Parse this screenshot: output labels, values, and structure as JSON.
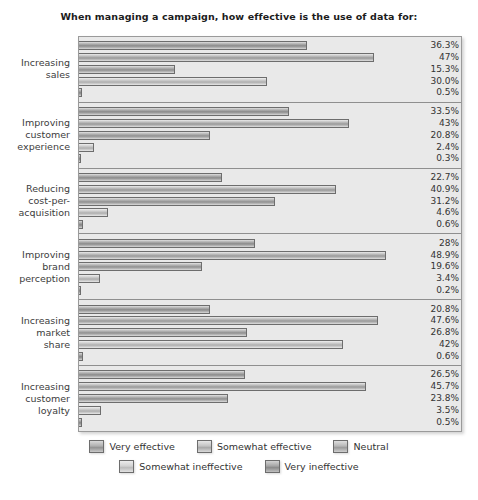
{
  "chart_data": {
    "type": "bar",
    "orientation": "horizontal",
    "title": "When managing a campaign, how effective is the use of data for:",
    "xlabel": "",
    "ylabel": "",
    "grid": false,
    "legend_position": "bottom",
    "xlim": [
      0,
      50
    ],
    "categories": [
      "Increasing sales",
      "Improving customer experience",
      "Reducing cost-per-acquisition",
      "Improving brand perception",
      "Increasing market share",
      "Increasing customer loyalty"
    ],
    "series": [
      {
        "name": "Very effective",
        "values": [
          36.3,
          33.5,
          22.7,
          28.0,
          20.8,
          26.5
        ]
      },
      {
        "name": "Somewhat effective",
        "values": [
          47.0,
          43.0,
          40.9,
          48.9,
          47.6,
          45.7
        ]
      },
      {
        "name": "Neutral",
        "values": [
          15.3,
          20.8,
          31.2,
          19.6,
          26.8,
          23.8
        ]
      },
      {
        "name": "Somewhat ineffective",
        "values": [
          30.0,
          2.4,
          4.6,
          3.4,
          42.0,
          3.5
        ]
      },
      {
        "name": "Very ineffective",
        "values": [
          0.5,
          0.3,
          0.6,
          0.2,
          0.6,
          0.5
        ]
      }
    ],
    "value_labels": [
      [
        "36.3%",
        "47%",
        "15.3%",
        "30.0%",
        "0.5%"
      ],
      [
        "33.5%",
        "43%",
        "20.8%",
        "2.4%",
        "0.3%"
      ],
      [
        "22.7%",
        "40.9%",
        "31.2%",
        "4.6%",
        "0.6%"
      ],
      [
        "28%",
        "48.9%",
        "19.6%",
        "3.4%",
        "0.2%"
      ],
      [
        "20.8%",
        "47.6%",
        "26.8%",
        "42%",
        "0.6%"
      ],
      [
        "26.5%",
        "45.7%",
        "23.8%",
        "3.5%",
        "0.5%"
      ]
    ]
  },
  "title": {
    "text": "When managing a campaign, how effective is the use of data for:"
  },
  "categories": [
    {
      "lines": [
        "Increasing",
        "sales"
      ]
    },
    {
      "lines": [
        "Improving",
        "customer",
        "experience"
      ]
    },
    {
      "lines": [
        "Reducing",
        "cost-per-",
        "acquisition"
      ]
    },
    {
      "lines": [
        "Improving",
        "brand",
        "perception"
      ]
    },
    {
      "lines": [
        "Increasing",
        "market",
        "share"
      ]
    },
    {
      "lines": [
        "Increasing",
        "customer",
        "loyalty"
      ]
    }
  ],
  "groups": [
    {
      "bars": [
        {
          "label": "36.3%",
          "pct": 36.3
        },
        {
          "label": "47%",
          "pct": 47.0
        },
        {
          "label": "15.3%",
          "pct": 15.3
        },
        {
          "label": "30.0%",
          "pct": 30.0
        },
        {
          "label": "0.5%",
          "pct": 0.5
        }
      ]
    },
    {
      "bars": [
        {
          "label": "33.5%",
          "pct": 33.5
        },
        {
          "label": "43%",
          "pct": 43.0
        },
        {
          "label": "20.8%",
          "pct": 20.8
        },
        {
          "label": "2.4%",
          "pct": 2.4
        },
        {
          "label": "0.3%",
          "pct": 0.3
        }
      ]
    },
    {
      "bars": [
        {
          "label": "22.7%",
          "pct": 22.7
        },
        {
          "label": "40.9%",
          "pct": 40.9
        },
        {
          "label": "31.2%",
          "pct": 31.2
        },
        {
          "label": "4.6%",
          "pct": 4.6
        },
        {
          "label": "0.6%",
          "pct": 0.6
        }
      ]
    },
    {
      "bars": [
        {
          "label": "28%",
          "pct": 28.0
        },
        {
          "label": "48.9%",
          "pct": 48.9
        },
        {
          "label": "19.6%",
          "pct": 19.6
        },
        {
          "label": "3.4%",
          "pct": 3.4
        },
        {
          "label": "0.2%",
          "pct": 0.2
        }
      ]
    },
    {
      "bars": [
        {
          "label": "20.8%",
          "pct": 20.8
        },
        {
          "label": "47.6%",
          "pct": 47.6
        },
        {
          "label": "26.8%",
          "pct": 26.8
        },
        {
          "label": "42%",
          "pct": 42.0
        },
        {
          "label": "0.6%",
          "pct": 0.6
        }
      ]
    },
    {
      "bars": [
        {
          "label": "26.5%",
          "pct": 26.5
        },
        {
          "label": "45.7%",
          "pct": 45.7
        },
        {
          "label": "23.8%",
          "pct": 23.8
        },
        {
          "label": "3.5%",
          "pct": 3.5
        },
        {
          "label": "0.5%",
          "pct": 0.5
        }
      ]
    }
  ],
  "legend": {
    "row1": [
      {
        "label": "Very effective"
      },
      {
        "label": "Somewhat effective"
      },
      {
        "label": "Neutral"
      }
    ],
    "row2": [
      {
        "label": "Somewhat ineffective"
      },
      {
        "label": "Very ineffective"
      }
    ]
  },
  "scale": {
    "max_pct": 50
  }
}
